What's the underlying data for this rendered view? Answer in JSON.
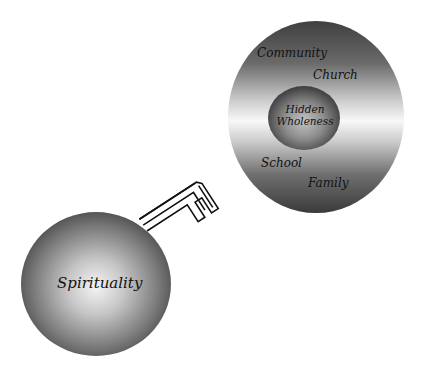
{
  "diagram": {
    "type": "concept-diagram",
    "nodes": [
      {
        "id": "spirituality",
        "label": "Spirituality",
        "shape": "sphere",
        "fill_style": "radial-gradient",
        "colors": {
          "center": "#f2f2f2",
          "edge": "#4a4a4a"
        }
      },
      {
        "id": "outer-circle",
        "shape": "disc",
        "fill_style": "horizontal-band-gradient",
        "colors": {
          "top": "#3d3d3d",
          "middle": "#f7f7f7",
          "bottom": "#3d3d3d"
        },
        "labels": [
          "Community",
          "Church",
          "School",
          "Family"
        ]
      },
      {
        "id": "hidden-wholeness",
        "label_lines": [
          "Hidden",
          "Wholeness"
        ],
        "shape": "sphere",
        "fill_style": "radial-gradient",
        "colors": {
          "center": "#bdbdbd",
          "edge": "#3a3a3a"
        }
      }
    ],
    "connector": {
      "type": "key",
      "from": "spirituality",
      "to": "outer-circle",
      "stroke": "#111111"
    },
    "labels": {
      "spirituality": "Spirituality",
      "community": "Community",
      "church": "Church",
      "school": "School",
      "family": "Family",
      "hidden": "Hidden",
      "wholeness": "Wholeness"
    }
  }
}
